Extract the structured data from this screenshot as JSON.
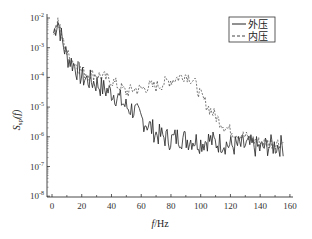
{
  "chart_data": {
    "type": "line",
    "title": "",
    "xlabel": "f/Hz",
    "ylabel": "S_sp(f)",
    "xlim": [
      -3,
      162
    ],
    "ylim": [
      1e-08,
      0.01
    ],
    "yscale": "log",
    "grid": false,
    "legend_position": "upper right",
    "x_ticks": [
      "0",
      "20",
      "40",
      "60",
      "80",
      "100",
      "120",
      "140",
      "160"
    ],
    "y_ticks": [
      "10^-2",
      "10^-3",
      "10^-4",
      "10^-5",
      "10^-6",
      "10^-7",
      "10^-8"
    ],
    "x": [
      1,
      4,
      7,
      10,
      15,
      20,
      25,
      30,
      35,
      40,
      45,
      50,
      55,
      60,
      65,
      70,
      75,
      80,
      85,
      90,
      95,
      100,
      105,
      110,
      115,
      120,
      125,
      130,
      135,
      140,
      145,
      150,
      156
    ],
    "series": [
      {
        "name": "外压",
        "style": "solid",
        "color": "#222222",
        "log10_values": [
          -2.5,
          -2.1,
          -2.8,
          -3.3,
          -3.6,
          -4.0,
          -4.1,
          -4.2,
          -4.4,
          -4.5,
          -4.7,
          -5.0,
          -5.1,
          -5.4,
          -5.6,
          -5.9,
          -6.0,
          -6.1,
          -6.0,
          -6.1,
          -6.1,
          -6.2,
          -6.1,
          -6.2,
          -6.2,
          -6.3,
          -6.3,
          -6.3,
          -6.3,
          -6.4,
          -6.3,
          -6.3,
          -6.3
        ]
      },
      {
        "name": "内压",
        "style": "dashed",
        "color": "#444444",
        "log10_values": [
          -2.5,
          -2.1,
          -2.7,
          -3.2,
          -3.5,
          -3.8,
          -3.9,
          -3.9,
          -4.0,
          -4.1,
          -4.3,
          -4.5,
          -4.4,
          -4.4,
          -4.3,
          -4.3,
          -4.2,
          -4.1,
          -4.0,
          -3.9,
          -4.1,
          -4.6,
          -5.0,
          -5.3,
          -5.6,
          -5.8,
          -5.9,
          -6.0,
          -6.1,
          -6.2,
          -6.2,
          -6.2,
          -6.2
        ]
      }
    ]
  },
  "legend": {
    "items": [
      {
        "label": "外压",
        "style": "solid"
      },
      {
        "label": "内压",
        "style": "dashed"
      }
    ]
  },
  "axes": {
    "xlabel_italic": "f",
    "xlabel_unit": "/Hz",
    "ylabel_main": "S",
    "ylabel_sub": "sp",
    "ylabel_arg": "(f)"
  }
}
